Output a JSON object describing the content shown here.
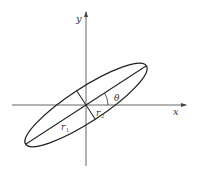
{
  "diagram": {
    "type": "rotated-ellipse",
    "labels": {
      "x_axis": "x",
      "y_axis": "y",
      "angle": "θ",
      "r1": "r",
      "r1_sub": "1",
      "r2": "r",
      "r2_sub": "2"
    },
    "geometry": {
      "origin": [
        86,
        105
      ],
      "semi_major": 72,
      "semi_minor": 17,
      "rotation_deg": -33,
      "angle_arc_radius": 22
    },
    "colors": {
      "stroke": "#222222",
      "axis": "#555555",
      "background": "#ffffff"
    }
  }
}
